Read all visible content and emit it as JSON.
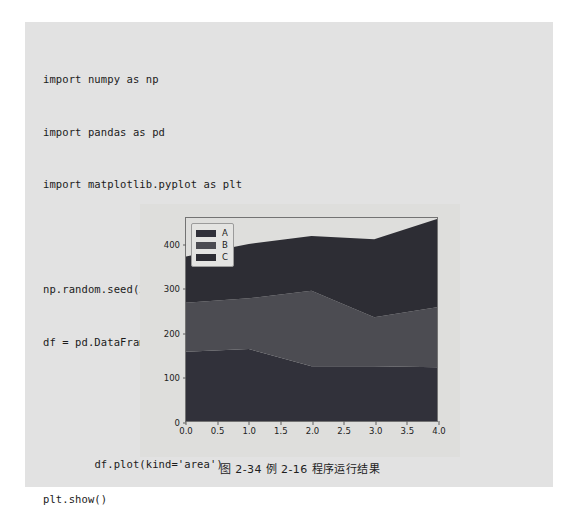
{
  "document": {
    "background_color": "#ffffff",
    "panel_color": "#e2e2e2"
  },
  "code": {
    "language": "python",
    "lines": [
      "import numpy as np",
      "import pandas as pd",
      "import matplotlib.pyplot as plt",
      "",
      "np.random.seed(20220630)",
      "df = pd.DataFrame(np.random.randint(100, 200, (5,3)),",
      "                  columns=['A','B','C'])",
      "df.plot(kind='area')",
      "plt.show()"
    ],
    "inline_comment": {
      "text": "# 绘制面积图",
      "on_line_index": 7
    }
  },
  "figure": {
    "caption": "图 2-34  例 2-16 程序运行结果",
    "background_color": "#dededc",
    "axes_edge_color": "#737373"
  },
  "chart_data": {
    "type": "area",
    "stacked": true,
    "title": "",
    "xlabel": "",
    "ylabel": "",
    "x": [
      0,
      1,
      2,
      3,
      4
    ],
    "xlim": [
      0,
      4
    ],
    "ylim": [
      0,
      460
    ],
    "xticks": [
      "0.0",
      "0.5",
      "1.0",
      "1.5",
      "2.0",
      "2.5",
      "3.0",
      "3.5",
      "4.0"
    ],
    "xtick_values": [
      0.0,
      0.5,
      1.0,
      1.5,
      2.0,
      2.5,
      3.0,
      3.5,
      4.0
    ],
    "yticks": [
      "0",
      "100",
      "200",
      "300",
      "400"
    ],
    "ytick_values": [
      0,
      100,
      200,
      300,
      400
    ],
    "grid": false,
    "legend_position": "upper left",
    "legend_entries": [
      "A",
      "B",
      "C"
    ],
    "series": [
      {
        "name": "A",
        "color": "#31313a",
        "values": [
          157,
          163,
          124,
          124,
          122
        ]
      },
      {
        "name": "B",
        "color": "#4c4c52",
        "values": [
          111,
          115,
          171,
          111,
          136
        ]
      },
      {
        "name": "C",
        "color": "#2d2d34",
        "values": [
          105,
          123,
          124,
          177,
          200
        ]
      }
    ],
    "cumulative_totals": [
      373,
      401,
      419,
      412,
      458
    ]
  }
}
